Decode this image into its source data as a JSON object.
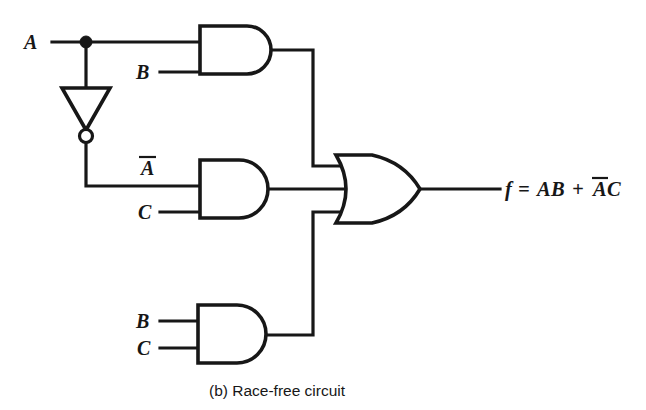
{
  "figure": {
    "caption": "(b)  Race-free circuit",
    "output_expression": "f = AB + AC",
    "output_expression_parts": {
      "lhs": "f",
      "equals": "=",
      "term1": "AB",
      "plus": "+",
      "term2_negated": "A",
      "term2_rest": "C"
    },
    "colors": {
      "ink": "#171717",
      "background": "#ffffff"
    }
  },
  "inputs": {
    "a_top": "A",
    "b_top": "B",
    "a_bar_mid": "A",
    "c_mid": "C",
    "b_bottom": "B",
    "c_bottom": "C"
  },
  "gates": [
    {
      "id": "and-top",
      "type": "AND",
      "inputs": [
        "A",
        "B"
      ],
      "output": "AB"
    },
    {
      "id": "inverter",
      "type": "NOT",
      "inputs": [
        "A"
      ],
      "output": "A-bar"
    },
    {
      "id": "and-middle",
      "type": "AND",
      "inputs": [
        "A-bar",
        "C"
      ],
      "output": "A-bar C"
    },
    {
      "id": "and-bottom",
      "type": "AND",
      "inputs": [
        "B",
        "C"
      ],
      "output": "BC"
    },
    {
      "id": "or-output",
      "type": "OR",
      "inputs": [
        "AB",
        "A-bar C",
        "BC"
      ],
      "output": "f"
    }
  ]
}
